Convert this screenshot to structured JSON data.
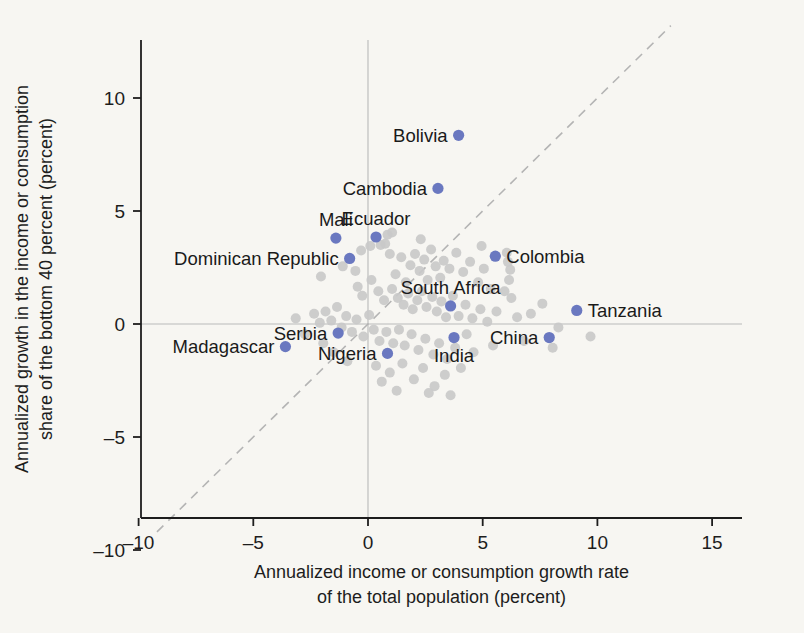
{
  "chart_data": {
    "type": "scatter",
    "title": "",
    "xlabel": "Annualized income or consumption growth rate of the total population (percent)",
    "xlabel_line1": "Annualized income or consumption growth rate",
    "xlabel_line2": "of the total population (percent)",
    "ylabel": "Annualized growth in the income or consumption share of the bottom 40 percent (percent)",
    "ylabel_line1": "Annualized growth in the income or consumption",
    "ylabel_line2": "share of the bottom 40 percent (percent)",
    "xlim": [
      -11.5,
      15.8
    ],
    "ylim": [
      -11.6,
      16.5
    ],
    "xticks": [
      -10,
      -5,
      0,
      5,
      10,
      15
    ],
    "yticks": [
      -10,
      -5,
      0,
      5,
      10,
      15
    ],
    "xtick_labels": [
      "–10",
      "–5",
      "0",
      "5",
      "10",
      "15"
    ],
    "ytick_labels": [
      "–10",
      "–5",
      "0",
      "5",
      "10",
      "15"
    ],
    "grid": false,
    "legend": "none",
    "reference_lines": [
      {
        "name": "zero-horizontal",
        "type": "horizontal",
        "value": 0,
        "style": "solid",
        "color": "#b9b9b9"
      },
      {
        "name": "zero-vertical",
        "type": "vertical",
        "value": 0,
        "style": "solid",
        "color": "#b9b9b9"
      },
      {
        "name": "forty-five-degree",
        "type": "diagonal",
        "from": [
          -9.2,
          -9.2
        ],
        "to": [
          13.2,
          13.2
        ],
        "style": "dashed",
        "color": "#b4b4b4"
      }
    ],
    "marker_colors": {
      "highlight": "#6a78c0",
      "other": "#c9c9c9"
    },
    "labeled_points": [
      {
        "label": "Bolivia",
        "x": 3.95,
        "y": 8.35,
        "label_pos": "left"
      },
      {
        "label": "Cambodia",
        "x": 3.05,
        "y": 6.0,
        "label_pos": "left"
      },
      {
        "label": "Ecuador",
        "x": 0.35,
        "y": 3.85,
        "label_pos": "above"
      },
      {
        "label": "Mali",
        "x": -1.4,
        "y": 3.8,
        "label_pos": "above"
      },
      {
        "label": "Dominican Republic",
        "x": -0.8,
        "y": 2.9,
        "label_pos": "left"
      },
      {
        "label": "Colombia",
        "x": 5.55,
        "y": 3.0,
        "label_pos": "right"
      },
      {
        "label": "South Africa",
        "x": 3.6,
        "y": 0.8,
        "label_pos": "above"
      },
      {
        "label": "Tanzania",
        "x": 9.1,
        "y": 0.6,
        "label_pos": "right"
      },
      {
        "label": "Serbia",
        "x": -1.3,
        "y": -0.4,
        "label_pos": "left"
      },
      {
        "label": "India",
        "x": 3.75,
        "y": -0.6,
        "label_pos": "below"
      },
      {
        "label": "China",
        "x": 7.9,
        "y": -0.6,
        "label_pos": "left"
      },
      {
        "label": "Madagascar",
        "x": -3.6,
        "y": -1.0,
        "label_pos": "left"
      },
      {
        "label": "Nigeria",
        "x": 0.85,
        "y": -1.3,
        "label_pos": "left"
      }
    ],
    "other_points": [
      {
        "x": -2.05,
        "y": 2.1
      },
      {
        "x": -1.1,
        "y": 2.55
      },
      {
        "x": -0.55,
        "y": 2.35
      },
      {
        "x": -0.3,
        "y": 3.25
      },
      {
        "x": 0.75,
        "y": 3.55
      },
      {
        "x": 0.95,
        "y": 3.1
      },
      {
        "x": 1.2,
        "y": 2.2
      },
      {
        "x": 1.45,
        "y": 2.95
      },
      {
        "x": 1.65,
        "y": 1.85
      },
      {
        "x": 1.85,
        "y": 2.6
      },
      {
        "x": 2.05,
        "y": 3.1
      },
      {
        "x": 2.25,
        "y": 2.35
      },
      {
        "x": 2.45,
        "y": 2.85
      },
      {
        "x": 2.6,
        "y": 1.95
      },
      {
        "x": 2.75,
        "y": 3.3
      },
      {
        "x": 2.95,
        "y": 2.55
      },
      {
        "x": 3.15,
        "y": 2.05
      },
      {
        "x": 3.3,
        "y": 2.8
      },
      {
        "x": 3.55,
        "y": 2.45
      },
      {
        "x": 3.85,
        "y": 3.15
      },
      {
        "x": 4.15,
        "y": 2.3
      },
      {
        "x": 4.45,
        "y": 2.75
      },
      {
        "x": 4.8,
        "y": 1.85
      },
      {
        "x": 5.05,
        "y": 2.45
      },
      {
        "x": 5.35,
        "y": 1.55
      },
      {
        "x": 5.95,
        "y": 1.45
      },
      {
        "x": 6.15,
        "y": 1.95
      },
      {
        "x": 6.2,
        "y": 2.4
      },
      {
        "x": 6.25,
        "y": 1.15
      },
      {
        "x": 0.1,
        "y": 3.45
      },
      {
        "x": 0.55,
        "y": 3.5
      },
      {
        "x": -0.45,
        "y": 1.65
      },
      {
        "x": -0.25,
        "y": 1.25
      },
      {
        "x": 0.15,
        "y": 1.95
      },
      {
        "x": 0.45,
        "y": 1.45
      },
      {
        "x": 0.7,
        "y": 1.05
      },
      {
        "x": 1.05,
        "y": 1.55
      },
      {
        "x": 1.3,
        "y": 1.15
      },
      {
        "x": 1.55,
        "y": 0.85
      },
      {
        "x": 1.75,
        "y": 1.35
      },
      {
        "x": 1.95,
        "y": 0.65
      },
      {
        "x": 2.15,
        "y": 1.05
      },
      {
        "x": 2.35,
        "y": 1.45
      },
      {
        "x": 2.55,
        "y": 0.75
      },
      {
        "x": 2.8,
        "y": 1.2
      },
      {
        "x": 3.0,
        "y": 0.55
      },
      {
        "x": 3.2,
        "y": 1.0
      },
      {
        "x": 3.4,
        "y": 0.3
      },
      {
        "x": 3.7,
        "y": 1.25
      },
      {
        "x": 3.95,
        "y": 0.35
      },
      {
        "x": 4.25,
        "y": 0.85
      },
      {
        "x": 4.55,
        "y": 0.25
      },
      {
        "x": 4.9,
        "y": 0.65
      },
      {
        "x": 5.2,
        "y": 0.1
      },
      {
        "x": 5.6,
        "y": 0.55
      },
      {
        "x": 6.5,
        "y": 0.3
      },
      {
        "x": 7.1,
        "y": 0.45
      },
      {
        "x": 7.6,
        "y": 0.9
      },
      {
        "x": 8.3,
        "y": -0.15
      },
      {
        "x": 9.7,
        "y": -0.55
      },
      {
        "x": -2.35,
        "y": 0.45
      },
      {
        "x": -2.1,
        "y": 0.05
      },
      {
        "x": -1.85,
        "y": 0.55
      },
      {
        "x": -1.6,
        "y": 0.15
      },
      {
        "x": -1.35,
        "y": 0.75
      },
      {
        "x": -1.15,
        "y": -0.15
      },
      {
        "x": -0.95,
        "y": 0.35
      },
      {
        "x": -0.7,
        "y": -0.35
      },
      {
        "x": -0.5,
        "y": 0.2
      },
      {
        "x": -0.2,
        "y": -0.55
      },
      {
        "x": 0.05,
        "y": 0.4
      },
      {
        "x": 0.25,
        "y": -0.25
      },
      {
        "x": 0.5,
        "y": -0.75
      },
      {
        "x": 0.8,
        "y": -0.35
      },
      {
        "x": 1.1,
        "y": -0.85
      },
      {
        "x": 1.35,
        "y": -0.25
      },
      {
        "x": 1.6,
        "y": -0.95
      },
      {
        "x": 1.9,
        "y": -0.45
      },
      {
        "x": 2.2,
        "y": -1.15
      },
      {
        "x": 2.5,
        "y": -0.65
      },
      {
        "x": 2.85,
        "y": -1.35
      },
      {
        "x": 3.1,
        "y": -0.85
      },
      {
        "x": 3.45,
        "y": -1.55
      },
      {
        "x": 3.8,
        "y": -1.05
      },
      {
        "x": 4.3,
        "y": -0.45
      },
      {
        "x": 4.6,
        "y": -1.25
      },
      {
        "x": 5.45,
        "y": -0.95
      },
      {
        "x": 6.8,
        "y": -0.75
      },
      {
        "x": 8.05,
        "y": -1.05
      },
      {
        "x": -3.15,
        "y": 0.25
      },
      {
        "x": -2.75,
        "y": -0.45
      },
      {
        "x": -1.95,
        "y": -0.85
      },
      {
        "x": -1.5,
        "y": -1.25
      },
      {
        "x": -0.9,
        "y": -1.65
      },
      {
        "x": 0.35,
        "y": -1.85
      },
      {
        "x": 0.95,
        "y": -2.15
      },
      {
        "x": 1.5,
        "y": -1.75
      },
      {
        "x": 2.0,
        "y": -2.45
      },
      {
        "x": 2.4,
        "y": -1.95
      },
      {
        "x": 2.9,
        "y": -2.75
      },
      {
        "x": 3.35,
        "y": -2.25
      },
      {
        "x": 3.6,
        "y": -3.15
      },
      {
        "x": 1.25,
        "y": -2.95
      },
      {
        "x": 2.65,
        "y": -3.05
      },
      {
        "x": 0.6,
        "y": -2.55
      },
      {
        "x": 4.05,
        "y": -1.95
      },
      {
        "x": 6.05,
        "y": 3.15
      },
      {
        "x": 6.1,
        "y": 2.75
      },
      {
        "x": 4.95,
        "y": 3.45
      },
      {
        "x": 2.3,
        "y": 3.75
      },
      {
        "x": 1.05,
        "y": 4.05
      },
      {
        "x": 0.85,
        "y": 3.95
      }
    ]
  }
}
